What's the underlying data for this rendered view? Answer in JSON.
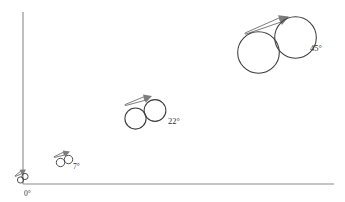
{
  "figure": {
    "type": "diagram",
    "title": "",
    "background_color": "#ffffff",
    "width": 345,
    "height": 202
  },
  "axes": {
    "axis_color": "#8a8a8a",
    "vertical": {
      "x": 23,
      "y_top": 12,
      "y_bottom": 184
    },
    "horizontal": {
      "y": 184,
      "x_left": 23,
      "x_right": 334
    },
    "origin": {
      "x": 23,
      "y": 184
    }
  },
  "style": {
    "circle_stroke": "#3b3b3b",
    "arrow_color": "#7d7d7d",
    "label_color": "#2e2e2e"
  },
  "groups": [
    {
      "id": "group-0",
      "label": "0°",
      "angle_degrees": 0,
      "label_x": 24,
      "label_y": 196,
      "label_size": "small",
      "circles": [
        {
          "cx": 20.5,
          "cy": 180.0,
          "r": 3.1
        },
        {
          "cx": 25.0,
          "cy": 176.5,
          "r": 3.1
        }
      ],
      "arrow": {
        "x1": 15.5,
        "y1": 176.0,
        "x2": 26.0,
        "y2": 169.5,
        "width": 2.2
      }
    },
    {
      "id": "group-7",
      "label": "7°",
      "angle_degrees": 7,
      "label_x": 73,
      "label_y": 169,
      "label_size": "small",
      "circles": [
        {
          "cx": 60.5,
          "cy": 162.5,
          "r": 4.2
        },
        {
          "cx": 68.5,
          "cy": 159.5,
          "r": 4.2
        }
      ],
      "arrow": {
        "x1": 54.5,
        "y1": 157.0,
        "x2": 70.0,
        "y2": 151.5,
        "width": 2.4
      }
    },
    {
      "id": "group-22",
      "label": "22°",
      "angle_degrees": 22,
      "label_x": 168,
      "label_y": 124,
      "label_size": "normal",
      "circles": [
        {
          "cx": 135.5,
          "cy": 118.5,
          "r": 10.6
        },
        {
          "cx": 155.0,
          "cy": 110.5,
          "r": 10.9
        }
      ],
      "arrow": {
        "x1": 125.5,
        "y1": 105.0,
        "x2": 152.0,
        "y2": 96.0,
        "width": 3.0
      }
    },
    {
      "id": "group-45",
      "label": "45°",
      "angle_degrees": 45,
      "label_x": 310,
      "label_y": 51,
      "label_size": "normal",
      "circles": [
        {
          "cx": 258.5,
          "cy": 52.5,
          "r": 20.8
        },
        {
          "cx": 295.5,
          "cy": 37.5,
          "r": 20.8
        }
      ],
      "arrow": {
        "x1": 245.5,
        "y1": 33.5,
        "x2": 289.0,
        "y2": 16.5,
        "width": 3.6
      }
    }
  ]
}
